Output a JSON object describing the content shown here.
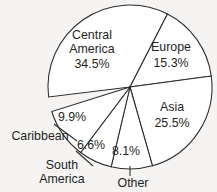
{
  "chart_data": {
    "type": "pie",
    "title": "",
    "subtitle": "",
    "xlabel": "",
    "ylabel": "",
    "legend": "none",
    "grid": false,
    "value_suffix": "%",
    "categories": [
      "Central America",
      "Europe",
      "Asia",
      "Other",
      "South America",
      "Caribbean"
    ],
    "values": [
      34.5,
      15.3,
      25.5,
      8.1,
      6.6,
      9.9
    ],
    "slices": [
      {
        "name": "Central America",
        "value": 34.5,
        "value_label": "34.5%",
        "label_placement": "inside",
        "name_line_1": "Central",
        "name_line_2": "America",
        "name_x": 92,
        "name_y_1": 36,
        "name_y_2": 50,
        "pct_x": 92,
        "pct_y": 65,
        "start_angle": 173.0,
        "end_angle": 297.2
      },
      {
        "name": "Europe",
        "value": 15.3,
        "value_label": "15.3%",
        "label_placement": "inside",
        "name_line_1": "Europe",
        "name_line_2": "",
        "name_x": 171,
        "name_y_1": 48,
        "name_y_2": 0,
        "pct_x": 171,
        "pct_y": 64,
        "start_angle": 297.2,
        "end_angle": 352.3
      },
      {
        "name": "Asia",
        "value": 25.5,
        "value_label": "25.5%",
        "label_placement": "inside",
        "name_line_1": "Asia",
        "name_line_2": "",
        "name_x": 172,
        "name_y_1": 108,
        "name_y_2": 0,
        "pct_x": 172,
        "pct_y": 124,
        "start_angle": 352.3,
        "end_angle": 74.1
      },
      {
        "name": "Other",
        "value": 8.1,
        "value_label": "8.1%",
        "label_placement": "outside",
        "name_line_1": "Other",
        "name_line_2": "",
        "name_x": 133,
        "name_y_1": 184,
        "name_y_2": 0,
        "pct_x": 126,
        "pct_y": 152,
        "start_angle": 74.1,
        "end_angle": 103.3
      },
      {
        "name": "South America",
        "value": 6.6,
        "value_label": "6.6%",
        "label_placement": "outside",
        "name_line_1": "South",
        "name_line_2": "America",
        "name_x": 62,
        "name_y_1": 166,
        "name_y_2": 180,
        "pct_x": 91,
        "pct_y": 146,
        "start_angle": 103.3,
        "end_angle": 127.0
      },
      {
        "name": "Caribbean",
        "value": 9.9,
        "value_label": "9.9%",
        "label_placement": "outside",
        "name_line_1": "Caribbean",
        "name_line_2": "",
        "name_x": 40,
        "name_y_1": 137,
        "name_y_2": 0,
        "pct_x": 72,
        "pct_y": 118,
        "start_angle": 127.0,
        "end_angle": 162.6
      }
    ],
    "geometry": {
      "center_x": 130,
      "center_y": 87,
      "radius": 82
    },
    "colors": {
      "slice_fill": "#ffffff",
      "slice_stroke": "#2b2b2b",
      "text": "#1f1f1f",
      "background": "#f5f4f2"
    },
    "leader_lines": [
      {
        "name": "caribbean-leader",
        "x1": 54,
        "y1": 124,
        "x2": 77,
        "y2": 141
      },
      {
        "name": "south-america-leader",
        "x1": 76,
        "y1": 151,
        "x2": 93,
        "y2": 166
      },
      {
        "name": "other-leader",
        "x1": 130,
        "y1": 166,
        "x2": 130,
        "y2": 176
      }
    ]
  }
}
